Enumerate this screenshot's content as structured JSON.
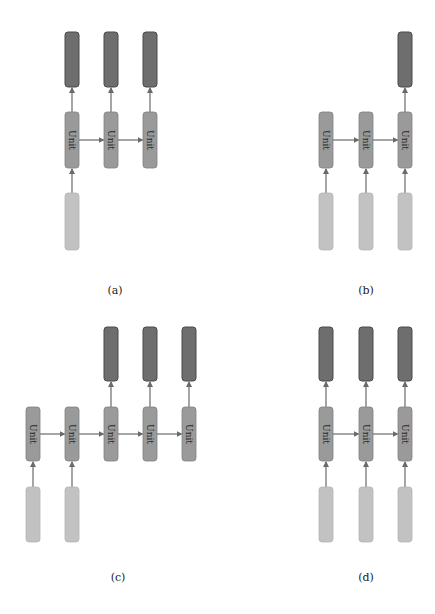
{
  "colors": {
    "output_fill": "#6e6e6e",
    "output_stroke": "#4a4a4a",
    "unit_fill": "#9a9a9a",
    "unit_stroke": "#808080",
    "input_fill": "#c2c2c2",
    "input_stroke": "#b5b5b5",
    "arrow": "#6a6a6a",
    "text": "#222222"
  },
  "unit_label": "Unit",
  "box_width": 14,
  "panels": [
    {
      "id": "a",
      "caption": "(a)",
      "caption_pos": [
        115,
        284
      ],
      "columns_x": [
        65,
        104,
        143
      ],
      "output_y": [
        32,
        87
      ],
      "unit_y": [
        112,
        168
      ],
      "input_y": [
        193,
        250
      ],
      "outputs": [
        0,
        1,
        2
      ],
      "units": [
        0,
        1,
        2
      ],
      "inputs": [
        0
      ]
    },
    {
      "id": "b",
      "caption": "(b)",
      "caption_pos": [
        366,
        284
      ],
      "columns_x": [
        319,
        359,
        398
      ],
      "output_y": [
        32,
        87
      ],
      "unit_y": [
        112,
        168
      ],
      "input_y": [
        193,
        250
      ],
      "outputs": [
        2
      ],
      "units": [
        0,
        1,
        2
      ],
      "inputs": [
        0,
        1,
        2
      ]
    },
    {
      "id": "c",
      "caption": "(c)",
      "caption_pos": [
        118,
        571
      ],
      "columns_x": [
        26,
        65,
        104,
        143,
        182
      ],
      "output_y": [
        327,
        381
      ],
      "unit_y": [
        407,
        461
      ],
      "input_y": [
        487,
        542
      ],
      "outputs": [
        2,
        3,
        4
      ],
      "units": [
        0,
        1,
        2,
        3,
        4
      ],
      "inputs": [
        0,
        1
      ]
    },
    {
      "id": "d",
      "caption": "(d)",
      "caption_pos": [
        366,
        571
      ],
      "columns_x": [
        319,
        359,
        398
      ],
      "output_y": [
        327,
        381
      ],
      "unit_y": [
        407,
        461
      ],
      "input_y": [
        487,
        542
      ],
      "outputs": [
        0,
        1,
        2
      ],
      "units": [
        0,
        1,
        2
      ],
      "inputs": [
        0,
        1,
        2
      ]
    }
  ]
}
